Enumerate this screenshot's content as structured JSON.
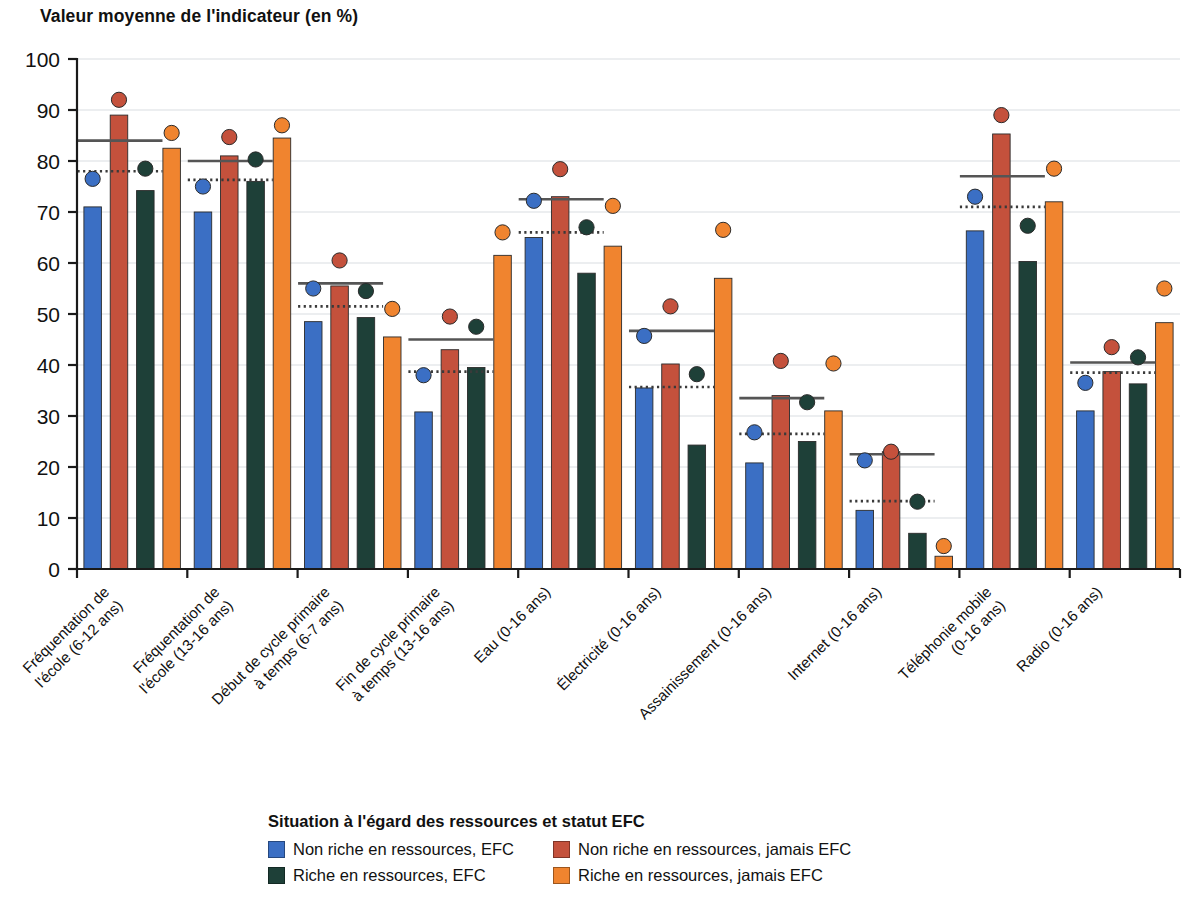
{
  "title": "Valeur moyenne de l'indicateur (en %)",
  "legend": {
    "title": "Situation à l'égard des ressources et statut EFC",
    "items": [
      {
        "label": "Non riche en ressources, EFC",
        "color": "#3b6fc4"
      },
      {
        "label": "Non riche en ressources, jamais EFC",
        "color": "#c4513c"
      },
      {
        "label": "Riche en ressources, EFC",
        "color": "#1e4038"
      },
      {
        "label": "Riche en ressources, jamais EFC",
        "color": "#f0842f"
      }
    ]
  },
  "chart_data": {
    "type": "bar",
    "title": "Valeur moyenne de l'indicateur (en %)",
    "xlabel": "",
    "ylabel": "Valeur moyenne de l'indicateur (en %)",
    "ylim": [
      0,
      100
    ],
    "yticks": [
      0,
      10,
      20,
      30,
      40,
      50,
      60,
      70,
      80,
      90,
      100
    ],
    "grid": true,
    "legend_position": "bottom",
    "categories": [
      "Fréquentation de\nl'école (6-12 ans)",
      "Fréquentation de\nl'école (13-16 ans)",
      "Début de cycle primaire\nà temps (6-7 ans)",
      "Fin de cycle primaire\nà temps (13-16 ans)",
      "Eau (0-16 ans)",
      "Électricité (0-16 ans)",
      "Assainissement (0-16 ans)",
      "Internet (0-16 ans)",
      "Téléphonie mobile\n(0-16 ans)",
      "Radio (0-16 ans)"
    ],
    "series": [
      {
        "name": "Non riche en ressources, EFC",
        "color": "#3b6fc4",
        "values": [
          71.0,
          70.0,
          48.5,
          30.8,
          65.0,
          35.5,
          20.8,
          11.5,
          66.3,
          31.0
        ]
      },
      {
        "name": "Non riche en ressources, jamais EFC",
        "color": "#c4513c",
        "values": [
          89.0,
          81.0,
          55.5,
          43.0,
          73.0,
          40.2,
          34.0,
          23.0,
          85.3,
          38.7
        ]
      },
      {
        "name": "Riche en ressources, EFC",
        "color": "#1e4038",
        "values": [
          74.2,
          76.0,
          49.3,
          39.5,
          58.0,
          24.3,
          25.0,
          7.0,
          60.3,
          36.3
        ]
      },
      {
        "name": "Riche en ressources, jamais EFC",
        "color": "#f0842f",
        "values": [
          82.5,
          84.5,
          45.5,
          61.5,
          63.3,
          57.0,
          31.0,
          2.5,
          72.0,
          48.3
        ]
      }
    ],
    "markers": [
      {
        "name": "Non riche en ressources, EFC",
        "color": "#3b6fc4",
        "values": [
          76.5,
          75.0,
          55.0,
          38.0,
          72.2,
          45.7,
          26.8,
          21.3,
          73.0,
          36.5
        ]
      },
      {
        "name": "Non riche en ressources, jamais EFC",
        "color": "#c4513c",
        "values": [
          92.0,
          84.7,
          60.5,
          49.5,
          78.4,
          51.5,
          40.8,
          23.0,
          89.0,
          43.5
        ]
      },
      {
        "name": "Riche en ressources, EFC",
        "color": "#1e4038",
        "values": [
          78.5,
          80.3,
          54.5,
          47.5,
          67.0,
          38.2,
          32.7,
          13.2,
          67.3,
          41.5
        ]
      },
      {
        "name": "Riche en ressources, jamais EFC",
        "color": "#f0842f",
        "values": [
          85.5,
          87.0,
          51.0,
          66.0,
          71.2,
          66.5,
          40.3,
          4.5,
          78.5,
          55.0
        ]
      }
    ],
    "reference_lines": {
      "solid": {
        "label": "moyenne non riche en ressources",
        "color": "#555555",
        "values": [
          84.0,
          80.0,
          56.0,
          45.0,
          72.5,
          46.7,
          33.5,
          22.5,
          77.0,
          40.5
        ]
      },
      "dotted": {
        "label": "moyenne riche en ressources",
        "color": "#3a3a3a",
        "values": [
          78.0,
          76.3,
          51.5,
          38.7,
          66.0,
          35.7,
          26.5,
          13.3,
          71.0,
          38.5
        ]
      }
    }
  }
}
